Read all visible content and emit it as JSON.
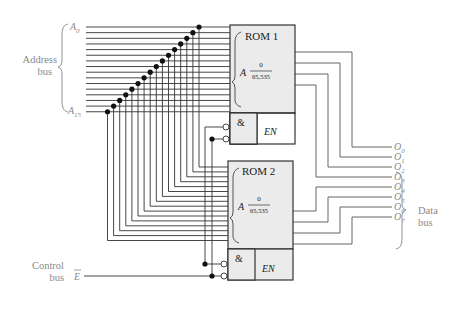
{
  "figure": {
    "address_bus": {
      "label_line1": "Address",
      "label_line2": "bus",
      "first": "A",
      "first_sub": "0",
      "last": "A",
      "last_sub": "15",
      "line_count": 16
    },
    "control_bus": {
      "label_line1": "Control",
      "label_line2": "bus",
      "signal": "E"
    },
    "data_bus": {
      "label_line1": "Data",
      "label_line2": "bus",
      "outputs": [
        {
          "name": "O",
          "sub": "0"
        },
        {
          "name": "O",
          "sub": "1"
        },
        {
          "name": "O",
          "sub": "2"
        },
        {
          "name": "O",
          "sub": "3"
        },
        {
          "name": "O",
          "sub": "4"
        },
        {
          "name": "O",
          "sub": "5"
        },
        {
          "name": "O",
          "sub": "6"
        },
        {
          "name": "O",
          "sub": "7"
        }
      ]
    },
    "roms": [
      {
        "title": "ROM 1",
        "addr_label": "A",
        "range_top": "0",
        "range_bottom": "65,535",
        "and_label": "&",
        "en_label": "EN"
      },
      {
        "title": "ROM 2",
        "addr_label": "A",
        "range_top": "0",
        "range_bottom": "65,535",
        "and_label": "&",
        "en_label": "EN"
      }
    ]
  }
}
